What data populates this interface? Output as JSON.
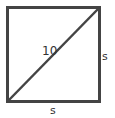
{
  "diagram": {
    "shape": "square",
    "diagonal_label": "10",
    "side_label_right": "s",
    "side_label_bottom": "s",
    "stroke_color": "#444444"
  }
}
